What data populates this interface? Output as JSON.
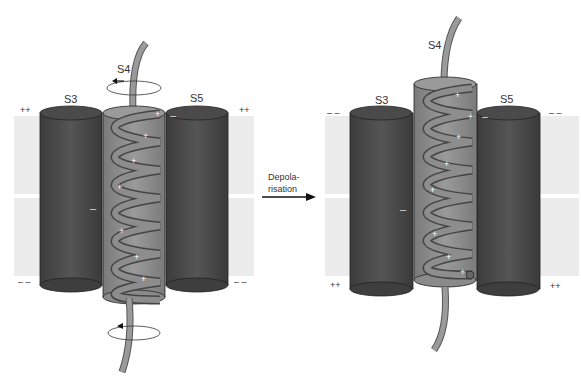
{
  "left_panel": {
    "state": "resting",
    "labels": {
      "s3": "S3",
      "s4": "S4",
      "s5": "S5"
    },
    "outer_charge_left": "++",
    "outer_charge_right": "++",
    "inner_charge_left": "– –",
    "inner_charge_right": "– –",
    "s3_charge": "–",
    "s5_charge": "–"
  },
  "right_panel": {
    "state": "depolarised",
    "labels": {
      "s3": "S3",
      "s4": "S4",
      "s5": "S5"
    },
    "outer_charge_left": "– –",
    "outer_charge_right": "– –",
    "inner_charge_left": "++",
    "inner_charge_right": "++",
    "s3_charge": "–",
    "s5_charge": "–"
  },
  "arrow": {
    "line1": "Depola-",
    "line2": "risation"
  },
  "colors": {
    "membrane": "#ececec",
    "helix_dark": "#4e4e4e",
    "s4_cylinder": "#8a8a8a",
    "strand": "#9a9a9a"
  }
}
